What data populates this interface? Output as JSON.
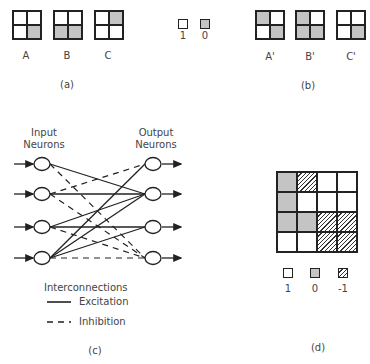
{
  "panel_a": {
    "caption": "(a)",
    "patterns": [
      {
        "label": "A",
        "cells": [
          "w",
          "w",
          "w",
          "g"
        ]
      },
      {
        "label": "B",
        "cells": [
          "w",
          "w",
          "g",
          "g"
        ]
      },
      {
        "label": "C",
        "cells": [
          "w",
          "g",
          "w",
          "w"
        ]
      }
    ]
  },
  "key_top": {
    "items": [
      {
        "value": "1",
        "style": "w"
      },
      {
        "value": "0",
        "style": "g"
      }
    ]
  },
  "panel_b": {
    "caption": "(b)",
    "patterns": [
      {
        "label": "A'",
        "cells": [
          "g",
          "w",
          "w",
          "g"
        ]
      },
      {
        "label": "B'",
        "cells": [
          "g",
          "w",
          "g",
          "g"
        ]
      },
      {
        "label": "C'",
        "cells": [
          "w",
          "w",
          "w",
          "g"
        ]
      }
    ]
  },
  "panel_c": {
    "caption": "(c)",
    "input_label_1": "Input",
    "input_label_2": "Neurons",
    "output_label_1": "Output",
    "output_label_2": "Neurons",
    "legend_title": "Interconnections",
    "legend_excitation": "Excitation",
    "legend_inhibition": "Inhibition",
    "excitation": [
      [
        1,
        2
      ],
      [
        2,
        2
      ],
      [
        3,
        2
      ],
      [
        3,
        3
      ],
      [
        4,
        1
      ],
      [
        4,
        2
      ],
      [
        4,
        3
      ]
    ],
    "inhibition": [
      [
        1,
        4
      ],
      [
        2,
        4
      ],
      [
        3,
        4
      ],
      [
        4,
        4
      ],
      [
        2,
        1
      ]
    ]
  },
  "panel_d": {
    "caption": "(d)",
    "matrix": [
      [
        "g",
        "h",
        "w",
        "w"
      ],
      [
        "g",
        "w",
        "w",
        "w"
      ],
      [
        "g",
        "g",
        "h",
        "h"
      ],
      [
        "w",
        "w",
        "h",
        "h"
      ]
    ],
    "key": [
      {
        "value": "1",
        "style": "w"
      },
      {
        "value": "0",
        "style": "g"
      },
      {
        "value": "-1",
        "style": "h"
      }
    ]
  }
}
